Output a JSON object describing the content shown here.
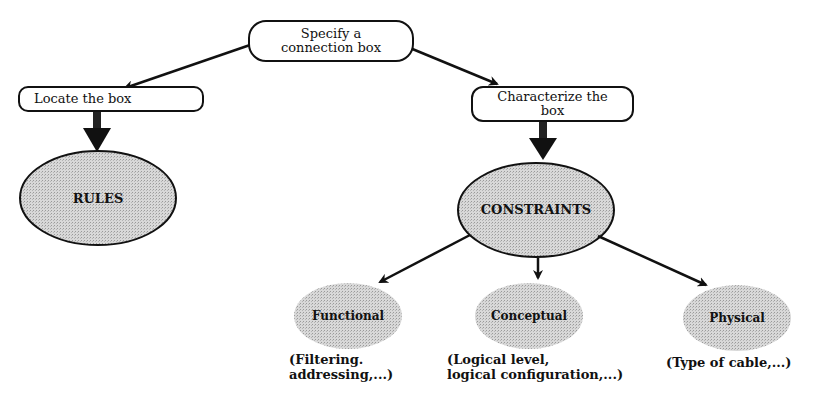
{
  "diagram": {
    "root": {
      "label_line1": "Specify a",
      "label_line2": "connection box"
    },
    "left_task": {
      "label": "Locate the box"
    },
    "right_task": {
      "label_line1": "Characterize the",
      "label_line2": "box"
    },
    "rules": {
      "label": "RULES"
    },
    "constraints": {
      "label": "CONSTRAINTS"
    },
    "children": [
      {
        "label": "Functional",
        "note_line1": "(Filtering.",
        "note_line2": "addressing,...)"
      },
      {
        "label": "Conceptual",
        "note_line1": "(Logical level,",
        "note_line2": "logical configuration,...)"
      },
      {
        "label": "Physical",
        "note_line1": "(Type of cable,...)",
        "note_line2": ""
      }
    ]
  },
  "colors": {
    "ink": "#111111",
    "fill": "#cfcfcf",
    "background": "#ffffff"
  }
}
